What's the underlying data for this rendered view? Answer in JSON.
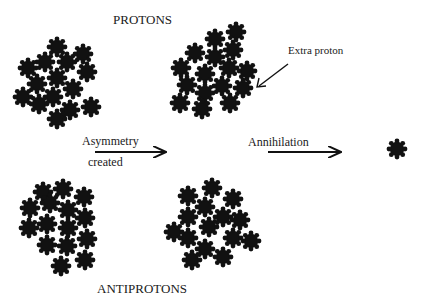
{
  "diagram": {
    "title_top": "PROTONS",
    "title_bottom": "ANTIPROTONS",
    "step1_label_line1": "Asymmetry",
    "step1_label_line2": "created",
    "step2_label": "Annihilation",
    "callout_label": "Extra proton",
    "colors": {
      "particle": "#111111",
      "text": "#1a1a1a",
      "background": "#ffffff"
    }
  },
  "clusters": {
    "protons_initial": [
      [
        57,
        47
      ],
      [
        83,
        54
      ],
      [
        45,
        62
      ],
      [
        67,
        62
      ],
      [
        28,
        68
      ],
      [
        87,
        72
      ],
      [
        57,
        78
      ],
      [
        37,
        84
      ],
      [
        73,
        89
      ],
      [
        23,
        97
      ],
      [
        53,
        97
      ],
      [
        39,
        104
      ],
      [
        70,
        110
      ],
      [
        91,
        107
      ],
      [
        57,
        119
      ]
    ],
    "protons_asymmetric": [
      [
        236,
        32
      ],
      [
        215,
        39
      ],
      [
        233,
        50
      ],
      [
        195,
        53
      ],
      [
        215,
        57
      ],
      [
        181,
        68
      ],
      [
        229,
        68
      ],
      [
        247,
        71
      ],
      [
        205,
        74
      ],
      [
        187,
        85
      ],
      [
        222,
        86
      ],
      [
        243,
        88
      ],
      [
        205,
        93
      ],
      [
        180,
        103
      ],
      [
        230,
        103
      ],
      [
        202,
        109
      ]
    ],
    "antiprotons_initial": [
      [
        43,
        192
      ],
      [
        63,
        189
      ],
      [
        84,
        197
      ],
      [
        50,
        203
      ],
      [
        30,
        208
      ],
      [
        68,
        210
      ],
      [
        85,
        218
      ],
      [
        47,
        224
      ],
      [
        29,
        228
      ],
      [
        68,
        228
      ],
      [
        87,
        239
      ],
      [
        47,
        245
      ],
      [
        67,
        246
      ],
      [
        85,
        260
      ],
      [
        61,
        266
      ]
    ],
    "antiprotons_after": [
      [
        212,
        188
      ],
      [
        188,
        196
      ],
      [
        233,
        199
      ],
      [
        205,
        207
      ],
      [
        188,
        217
      ],
      [
        223,
        217
      ],
      [
        240,
        220
      ],
      [
        209,
        227
      ],
      [
        174,
        232
      ],
      [
        188,
        238
      ],
      [
        233,
        238
      ],
      [
        251,
        241
      ],
      [
        205,
        249
      ],
      [
        223,
        257
      ],
      [
        192,
        260
      ]
    ],
    "survivor": [
      [
        397,
        149
      ]
    ]
  }
}
